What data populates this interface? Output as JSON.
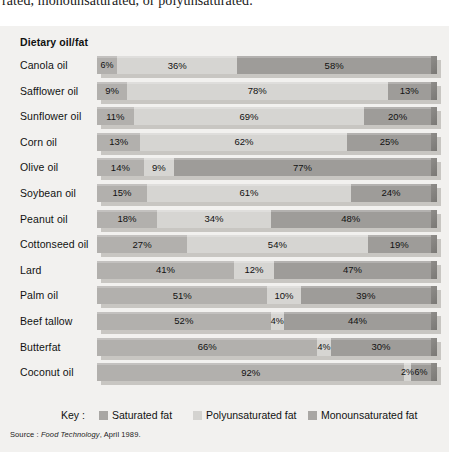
{
  "page_top_text": "rated, monounsaturated, or polyunsaturated.",
  "chart_header": "Dietary oil/fat",
  "legend": {
    "title": "Key :",
    "items": [
      {
        "label": "Saturated fat",
        "swatch": "sat",
        "color": "#a9a7a4"
      },
      {
        "label": "Polyunsaturated fat",
        "swatch": "poly",
        "color": "#d4d3d0"
      },
      {
        "label": "Monounsaturated fat",
        "swatch": "mono",
        "color": "#a9a7a4"
      }
    ]
  },
  "source": {
    "prefix": "Source : ",
    "publication": "Food Technology",
    "suffix": ", April 1989."
  },
  "colors": {
    "panel_background": "#f2f1ef",
    "saturated": "#b2b0ad",
    "polyunsaturated": "#d6d5d2",
    "monounsaturated": "#9e9c99",
    "bar_shadow": "#c8c6c2",
    "text": "#111111"
  },
  "chart_data": {
    "type": "bar",
    "orientation": "horizontal",
    "stacked": true,
    "normalized_percent": true,
    "title": "Dietary oil/fat",
    "xlabel": "",
    "ylabel": "Dietary oil/fat",
    "xlim": [
      0,
      100
    ],
    "grid": false,
    "legend_position": "bottom",
    "categories": [
      "Canola oil",
      "Safflower oil",
      "Sunflower oil",
      "Corn oil",
      "Olive oil",
      "Soybean oil",
      "Peanut oil",
      "Cottonseed oil",
      "Lard",
      "Palm oil",
      "Beef tallow",
      "Butterfat",
      "Coconut oil"
    ],
    "series": [
      {
        "name": "Saturated fat",
        "values": [
          6,
          9,
          11,
          13,
          14,
          15,
          18,
          27,
          41,
          51,
          52,
          66,
          92
        ]
      },
      {
        "name": "Polyunsaturated fat",
        "values": [
          36,
          78,
          69,
          62,
          9,
          61,
          34,
          54,
          12,
          10,
          4,
          4,
          2
        ]
      },
      {
        "name": "Monounsaturated fat",
        "values": [
          58,
          13,
          20,
          25,
          77,
          24,
          48,
          19,
          47,
          39,
          44,
          30,
          6
        ]
      }
    ],
    "rows": [
      {
        "label": "Canola oil",
        "segments": [
          {
            "type": "sat",
            "value": 6,
            "label": "6%"
          },
          {
            "type": "poly",
            "value": 36,
            "label": "36%"
          },
          {
            "type": "mono",
            "value": 58,
            "label": "58%"
          }
        ]
      },
      {
        "label": "Safflower oil",
        "segments": [
          {
            "type": "sat",
            "value": 9,
            "label": "9%"
          },
          {
            "type": "poly",
            "value": 78,
            "label": "78%"
          },
          {
            "type": "mono",
            "value": 13,
            "label": "13%"
          }
        ]
      },
      {
        "label": "Sunflower oil",
        "segments": [
          {
            "type": "sat",
            "value": 11,
            "label": "11%"
          },
          {
            "type": "poly",
            "value": 69,
            "label": "69%"
          },
          {
            "type": "mono",
            "value": 20,
            "label": "20%"
          }
        ]
      },
      {
        "label": "Corn oil",
        "segments": [
          {
            "type": "sat",
            "value": 13,
            "label": "13%"
          },
          {
            "type": "poly",
            "value": 62,
            "label": "62%"
          },
          {
            "type": "mono",
            "value": 25,
            "label": "25%"
          }
        ]
      },
      {
        "label": "Olive oil",
        "segments": [
          {
            "type": "sat",
            "value": 14,
            "label": "14%"
          },
          {
            "type": "poly",
            "value": 9,
            "label": "9%"
          },
          {
            "type": "mono",
            "value": 77,
            "label": "77%"
          }
        ]
      },
      {
        "label": "Soybean oil",
        "segments": [
          {
            "type": "sat",
            "value": 15,
            "label": "15%"
          },
          {
            "type": "poly",
            "value": 61,
            "label": "61%"
          },
          {
            "type": "mono",
            "value": 24,
            "label": "24%"
          }
        ]
      },
      {
        "label": "Peanut oil",
        "segments": [
          {
            "type": "sat",
            "value": 18,
            "label": "18%"
          },
          {
            "type": "poly",
            "value": 34,
            "label": "34%"
          },
          {
            "type": "mono",
            "value": 48,
            "label": "48%"
          }
        ]
      },
      {
        "label": "Cottonseed oil",
        "segments": [
          {
            "type": "sat",
            "value": 27,
            "label": "27%"
          },
          {
            "type": "poly",
            "value": 54,
            "label": "54%"
          },
          {
            "type": "mono",
            "value": 19,
            "label": "19%"
          }
        ]
      },
      {
        "label": "Lard",
        "segments": [
          {
            "type": "sat",
            "value": 41,
            "label": "41%"
          },
          {
            "type": "poly",
            "value": 12,
            "label": "12%"
          },
          {
            "type": "mono",
            "value": 47,
            "label": "47%"
          }
        ]
      },
      {
        "label": "Palm oil",
        "segments": [
          {
            "type": "sat",
            "value": 51,
            "label": "51%"
          },
          {
            "type": "poly",
            "value": 10,
            "label": "10%"
          },
          {
            "type": "mono",
            "value": 39,
            "label": "39%"
          }
        ]
      },
      {
        "label": "Beef tallow",
        "segments": [
          {
            "type": "sat",
            "value": 52,
            "label": "52%"
          },
          {
            "type": "poly",
            "value": 4,
            "label": "4%"
          },
          {
            "type": "mono",
            "value": 44,
            "label": "44%"
          }
        ]
      },
      {
        "label": "Butterfat",
        "segments": [
          {
            "type": "sat",
            "value": 66,
            "label": "66%"
          },
          {
            "type": "poly",
            "value": 4,
            "label": "4%"
          },
          {
            "type": "mono",
            "value": 30,
            "label": "30%"
          }
        ]
      },
      {
        "label": "Coconut oil",
        "segments": [
          {
            "type": "sat",
            "value": 92,
            "label": "92%"
          },
          {
            "type": "poly",
            "value": 2,
            "label": "2%"
          },
          {
            "type": "mono",
            "value": 6,
            "label": "6%"
          }
        ]
      }
    ]
  }
}
